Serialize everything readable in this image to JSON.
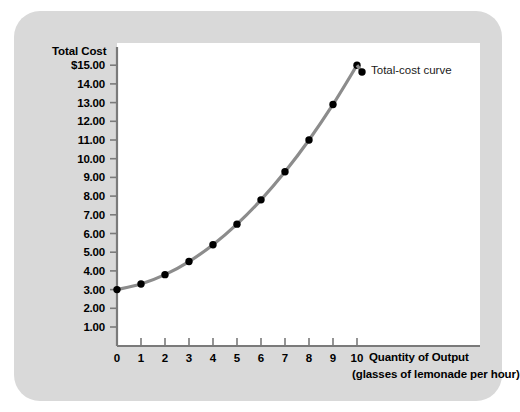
{
  "chart_data": {
    "type": "line",
    "title": "",
    "xlabel": "Quantity of Output",
    "xlabel_sub": "(glasses of lemonade per hour)",
    "ylabel": "Total Cost",
    "x": [
      0,
      1,
      2,
      3,
      4,
      5,
      6,
      7,
      8,
      9,
      10
    ],
    "values": [
      3.0,
      3.3,
      3.8,
      4.5,
      5.4,
      6.5,
      7.8,
      9.3,
      11.0,
      12.9,
      15.0
    ],
    "series": [
      {
        "name": "Total-cost curve",
        "values": [
          3.0,
          3.3,
          3.8,
          4.5,
          5.4,
          6.5,
          7.8,
          9.3,
          11.0,
          12.9,
          15.0
        ]
      }
    ],
    "xlim": [
      0,
      10
    ],
    "ylim": [
      0,
      15
    ],
    "grid": false,
    "legend_position": "inline-right",
    "annotations": [
      "Total-cost curve"
    ],
    "xtick_labels": [
      "0",
      "1",
      "2",
      "3",
      "4",
      "5",
      "6",
      "7",
      "8",
      "9",
      "10"
    ],
    "ytick_labels": [
      "1.00",
      "2.00",
      "3.00",
      "4.00",
      "5.00",
      "6.00",
      "7.00",
      "8.00",
      "9.00",
      "10.00",
      "11.00",
      "12.00",
      "13.00",
      "14.00",
      "$15.00"
    ],
    "ytick_values": [
      1,
      2,
      3,
      4,
      5,
      6,
      7,
      8,
      9,
      10,
      11,
      12,
      13,
      14,
      15
    ],
    "colors": {
      "curve": "#8c8c8c",
      "marker": "#000000",
      "axis": "#7a7a7a",
      "panel": "#d9d9d9",
      "plot_background": "#ffffff",
      "text": "#000000"
    }
  },
  "series_label": "Total-cost curve"
}
